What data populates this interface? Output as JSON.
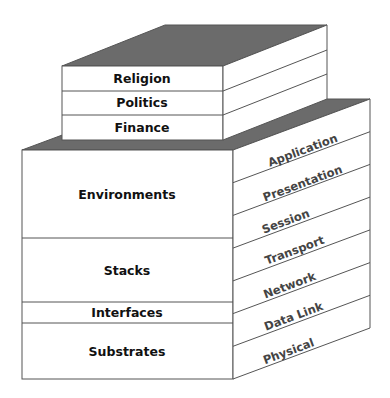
{
  "diagram": {
    "title": "",
    "colors": {
      "top_face": "#6b6b6b",
      "face_fill": "#ffffff",
      "edge": "#555555",
      "front_text": "#111111",
      "side_text": "#444444",
      "background": "#ffffff"
    },
    "upper_block": {
      "layers": [
        {
          "label": "Religion"
        },
        {
          "label": "Politics"
        },
        {
          "label": "Finance"
        }
      ]
    },
    "lower_block": {
      "front_layers": [
        {
          "label": "Environments"
        },
        {
          "label": "Stacks"
        },
        {
          "label": "Interfaces"
        },
        {
          "label": "Substrates"
        }
      ],
      "side_layers": [
        {
          "label": "Application"
        },
        {
          "label": "Presentation"
        },
        {
          "label": "Session"
        },
        {
          "label": "Transport"
        },
        {
          "label": "Network"
        },
        {
          "label": "Data Link"
        },
        {
          "label": "Physical"
        }
      ]
    }
  }
}
